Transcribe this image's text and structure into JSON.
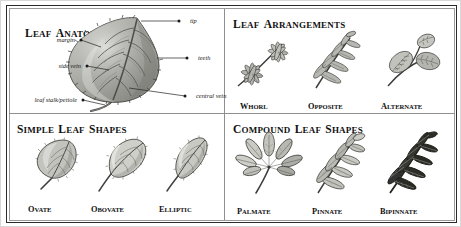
{
  "plate": {
    "title_visible": false,
    "border_color": "#2b2b2b",
    "inner_rule_color": "#9a9a9a",
    "background": "#ffffff",
    "ink_color": "#1a1a1a"
  },
  "sections": {
    "anatomy": {
      "heading": "Leaf Anatomy",
      "heading_caps": "LEAF ANATOMY",
      "subject": "serrated ovate leaf with pinnate venation",
      "callouts": [
        {
          "label": "tip",
          "side": "right"
        },
        {
          "label": "teeth",
          "side": "right"
        },
        {
          "label": "central vein",
          "side": "right"
        },
        {
          "label": "margin",
          "side": "left"
        },
        {
          "label": "side vein",
          "side": "left"
        },
        {
          "label": "leaf stalk/petiole",
          "side": "left"
        }
      ]
    },
    "arrangements": {
      "heading": "Leaf Arrangements",
      "heading_caps": "LEAF ARRANGEMENTS",
      "items": [
        {
          "label": "Whorl",
          "label_caps": "WHORL",
          "description": "leaves radiating in rosettes from each node"
        },
        {
          "label": "Opposite",
          "label_caps": "OPPOSITE",
          "description": "leaves in pairs directly across the stem"
        },
        {
          "label": "Alternate",
          "label_caps": "ALTERNATE",
          "description": "leaves staggered singly along the stem"
        }
      ]
    },
    "simple_shapes": {
      "heading": "Simple Leaf Shapes",
      "heading_caps": "SIMPLE LEAF SHAPES",
      "items": [
        {
          "label": "Ovate",
          "label_caps": "OVATE",
          "description": "egg-shaped, broadest below the middle"
        },
        {
          "label": "Obovate",
          "label_caps": "OBOVATE",
          "description": "egg-shaped, broadest above the middle"
        },
        {
          "label": "Elliptic",
          "label_caps": "ELLIPTIC",
          "description": "narrow, widest at the middle, tapered at both ends"
        }
      ]
    },
    "compound_shapes": {
      "heading": "Compound Leaf Shapes",
      "heading_caps": "COMPOUND LEAF SHAPES",
      "items": [
        {
          "label": "Palmate",
          "label_caps": "PALMATE",
          "description": "leaflets radiating from a single point"
        },
        {
          "label": "Pinnate",
          "label_caps": "PINNATE",
          "description": "leaflets paired along a central axis"
        },
        {
          "label": "Bipinnate",
          "label_caps": "BIPINNATE",
          "description": "twice-divided feathery leaflets"
        }
      ]
    }
  }
}
